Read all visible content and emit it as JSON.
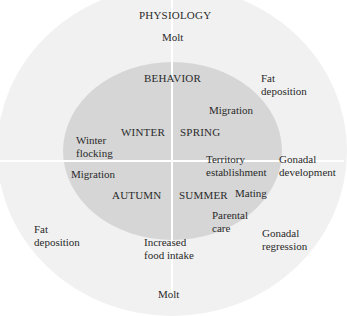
{
  "diagram": {
    "outer_ring_title": "PHYSIOLOGY",
    "inner_disc_title": "BEHAVIOR",
    "seasons": {
      "winter": "WINTER",
      "spring": "SPRING",
      "summer": "SUMMER",
      "autumn": "AUTUMN"
    },
    "behavior": {
      "winter_flocking": [
        "Winter",
        "flocking"
      ],
      "spring_migration": "Migration",
      "territory": [
        "Territory",
        "establishment"
      ],
      "mating": "Mating",
      "parental_care": [
        "Parental",
        "care"
      ],
      "food_intake": [
        "Increased",
        "food intake"
      ],
      "autumn_migration": "Migration"
    },
    "physiology": {
      "molt_top": "Molt",
      "fat_spring": [
        "Fat",
        "deposition"
      ],
      "gonadal_dev": [
        "Gonadal",
        "development"
      ],
      "gonadal_reg": [
        "Gonadal",
        "regression"
      ],
      "fat_autumn": [
        "Fat",
        "deposition"
      ],
      "molt_bottom": "Molt"
    },
    "colors": {
      "background": "#ffffff",
      "outer_ring": "#f1f1f1",
      "inner_disc": "#d6d6d6",
      "divider": "#ffffff",
      "text": "#2a2a2a"
    }
  }
}
